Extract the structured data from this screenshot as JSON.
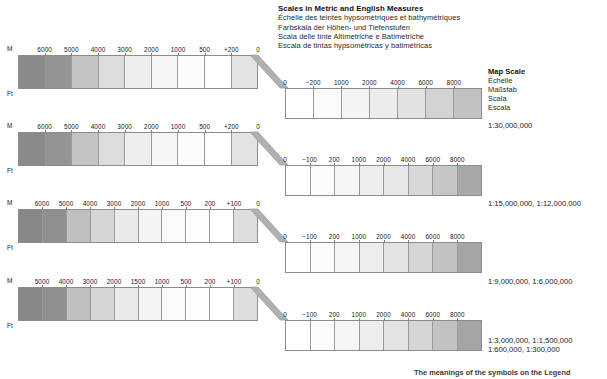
{
  "title": {
    "main": "Scales in Metric and English Measures",
    "line_fr": "Échelle des teintes hypsométriques et bathymétriques",
    "line_de": "Farbskala der Höhen- und Tiefenstufen",
    "line_it": "Scala delle tinte Altimetriche e Batimetriche",
    "line_es": "Escala de tintas hypsométricas y batimétricas"
  },
  "map_scale": {
    "title": "Map Scale",
    "line_fr": "Échelle",
    "line_de": "Maßstab",
    "line_it": "Scala",
    "line_es": "Escala",
    "ratio": "1:30,000,000"
  },
  "units": {
    "meters": "M",
    "feet": "Ft"
  },
  "footer": {
    "note": "The meanings of the symbols on the Legend"
  },
  "colors": {
    "elevation_high": "#7f7f7f",
    "elevation_low": "#ffffff",
    "bathy_shallow": "#ffffff",
    "bathy_deep": "#9e9e9e",
    "frame": "#8c8c8c",
    "connector": "#b0b0b0"
  },
  "chart_data": {
    "type": "table",
    "title": "Scales in Metric and English Measures",
    "rows": [
      {
        "ratio": "1:30,000,000",
        "elevation": {
          "unit": "M",
          "ticks": [
            "M",
            "6000",
            "5000",
            "4000",
            "3000",
            "2000",
            "1000",
            "500",
            "+200",
            "0"
          ],
          "band_colors": [
            "#8a8a8a",
            "#949494",
            "#c4c4c4",
            "#dcdcdc",
            "#eeeeee",
            "#f6f6f6",
            "#fcfcfc",
            "#ffffff",
            "#e3e3e3"
          ]
        },
        "bathymetry": {
          "ticks": [
            "0",
            "−200",
            "1000",
            "2000",
            "4000",
            "6000",
            "8000"
          ],
          "band_colors": [
            "#ffffff",
            "#fbfbfb",
            "#f4f4f4",
            "#ececec",
            "#e2e2e2",
            "#d2d2d2",
            "#c2c2c2"
          ]
        }
      },
      {
        "ratio": "1:15,000,000, 1:12,000,000",
        "elevation": {
          "unit": "M",
          "ticks": [
            "M",
            "6000",
            "5000",
            "4000",
            "3000",
            "2000",
            "1000",
            "500",
            "+200",
            "0"
          ],
          "band_colors": [
            "#8a8a8a",
            "#949494",
            "#c4c4c4",
            "#dcdcdc",
            "#eeeeee",
            "#f6f6f6",
            "#fcfcfc",
            "#ffffff",
            "#e3e3e3"
          ]
        },
        "bathymetry": {
          "ticks": [
            "0",
            "−100",
            "200",
            "1000",
            "2000",
            "4000",
            "6000",
            "8000"
          ],
          "band_colors": [
            "#ffffff",
            "#fcfcfc",
            "#f6f6f6",
            "#eeeeee",
            "#e6e6e6",
            "#d8d8d8",
            "#c6c6c6",
            "#a8a8a8"
          ]
        }
      },
      {
        "ratio": "1:9,000,000, 1:6,000,000",
        "elevation": {
          "unit": "M",
          "ticks": [
            "M",
            "6000",
            "5000",
            "4000",
            "3000",
            "2000",
            "1000",
            "500",
            "200",
            "+100",
            "0"
          ],
          "band_colors": [
            "#878787",
            "#8f8f8f",
            "#c0c0c0",
            "#d6d6d6",
            "#eaeaea",
            "#f4f4f4",
            "#fafafa",
            "#fdfdfd",
            "#ffffff",
            "#dedede"
          ]
        },
        "bathymetry": {
          "ticks": [
            "0",
            "−100",
            "200",
            "1000",
            "2000",
            "4000",
            "6000",
            "8000"
          ],
          "band_colors": [
            "#ffffff",
            "#fcfcfc",
            "#f5f5f5",
            "#ededed",
            "#e4e4e4",
            "#d6d6d6",
            "#c2c2c2",
            "#a5a5a5"
          ]
        }
      },
      {
        "ratio_line1": "1:3,000,000, 1:1,500,000",
        "ratio_line2": "1:600,000, 1:300,000",
        "elevation": {
          "unit": "M",
          "ticks": [
            "M",
            "5000",
            "4000",
            "3000",
            "2000",
            "1500",
            "1000",
            "500",
            "200",
            "+100",
            "0"
          ],
          "band_colors": [
            "#878787",
            "#8f8f8f",
            "#c0c0c0",
            "#d6d6d6",
            "#eaeaea",
            "#f4f4f4",
            "#fafafa",
            "#fdfdfd",
            "#ffffff",
            "#dedede"
          ]
        },
        "bathymetry": {
          "ticks": [
            "0",
            "−100",
            "200",
            "1000",
            "2000",
            "4000",
            "6000",
            "8000"
          ],
          "band_colors": [
            "#ffffff",
            "#fcfcfc",
            "#f5f5f5",
            "#ededed",
            "#e4e4e4",
            "#d6d6d6",
            "#c2c2c2",
            "#a5a5a5"
          ]
        }
      }
    ]
  }
}
